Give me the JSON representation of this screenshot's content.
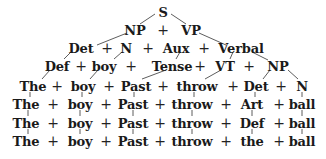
{
  "diagram": {
    "type": "phrase-structure derivation tree",
    "rows": [
      {
        "y": 12,
        "tokens": [
          {
            "text": "S",
            "x": 163
          }
        ]
      },
      {
        "y": 30,
        "tokens": [
          {
            "text": "NP",
            "x": 135
          },
          {
            "text": "+",
            "x": 163
          },
          {
            "text": "VP",
            "x": 191
          }
        ]
      },
      {
        "y": 48,
        "tokens": [
          {
            "text": "Det",
            "x": 81
          },
          {
            "text": "+",
            "x": 107
          },
          {
            "text": "N",
            "x": 126
          },
          {
            "text": "+",
            "x": 148
          },
          {
            "text": "Aux",
            "x": 176
          },
          {
            "text": "+",
            "x": 204
          },
          {
            "text": "Verbal",
            "x": 241
          }
        ]
      },
      {
        "y": 66,
        "tokens": [
          {
            "text": "Def",
            "x": 57
          },
          {
            "text": "+",
            "x": 81
          },
          {
            "text": "boy",
            "x": 104
          },
          {
            "text": "+",
            "x": 131
          },
          {
            "text": "Tense",
            "x": 172
          },
          {
            "text": "+",
            "x": 200
          },
          {
            "text": "VT",
            "x": 225
          },
          {
            "text": "+",
            "x": 249
          },
          {
            "text": "NP",
            "x": 278
          }
        ]
      },
      {
        "y": 86,
        "tokens": [
          {
            "text": "The",
            "x": 33
          },
          {
            "text": "+",
            "x": 57
          },
          {
            "text": "boy",
            "x": 83
          },
          {
            "text": "+",
            "x": 109
          },
          {
            "text": "Past",
            "x": 136
          },
          {
            "text": "+",
            "x": 163
          },
          {
            "text": "throw",
            "x": 197
          },
          {
            "text": "+",
            "x": 233
          },
          {
            "text": "Det",
            "x": 256
          },
          {
            "text": "+",
            "x": 281
          },
          {
            "text": "N",
            "x": 302
          }
        ]
      },
      {
        "y": 104,
        "tokens": [
          {
            "text": "The",
            "x": 26
          },
          {
            "text": "+",
            "x": 53
          },
          {
            "text": "boy",
            "x": 80
          },
          {
            "text": "+",
            "x": 106
          },
          {
            "text": "Past",
            "x": 133
          },
          {
            "text": "+",
            "x": 160
          },
          {
            "text": "throw",
            "x": 192
          },
          {
            "text": "+",
            "x": 226
          },
          {
            "text": "Art",
            "x": 252
          },
          {
            "text": "+",
            "x": 279
          },
          {
            "text": "ball",
            "x": 302
          }
        ]
      },
      {
        "y": 123,
        "tokens": [
          {
            "text": "The",
            "x": 26
          },
          {
            "text": "+",
            "x": 53
          },
          {
            "text": "boy",
            "x": 80
          },
          {
            "text": "+",
            "x": 106
          },
          {
            "text": "Past",
            "x": 133
          },
          {
            "text": "+",
            "x": 160
          },
          {
            "text": "throw",
            "x": 192
          },
          {
            "text": "+",
            "x": 226
          },
          {
            "text": "Def",
            "x": 252
          },
          {
            "text": "+",
            "x": 279
          },
          {
            "text": "ball",
            "x": 302
          }
        ]
      },
      {
        "y": 141,
        "tokens": [
          {
            "text": "The",
            "x": 26
          },
          {
            "text": "+",
            "x": 53
          },
          {
            "text": "boy",
            "x": 80
          },
          {
            "text": "+",
            "x": 106
          },
          {
            "text": "Past",
            "x": 133
          },
          {
            "text": "+",
            "x": 160
          },
          {
            "text": "throw",
            "x": 192
          },
          {
            "text": "+",
            "x": 226
          },
          {
            "text": "the",
            "x": 252
          },
          {
            "text": "+",
            "x": 279
          },
          {
            "text": "ball",
            "x": 302
          }
        ]
      }
    ],
    "edges": [
      [
        155,
        14,
        140,
        24
      ],
      [
        171,
        14,
        186,
        24
      ],
      [
        127,
        33,
        97,
        45
      ],
      [
        199,
        33,
        226,
        45
      ],
      [
        72,
        51,
        64,
        59
      ],
      [
        122,
        52,
        114,
        59
      ],
      [
        180,
        52,
        176,
        59
      ],
      [
        233,
        52,
        230,
        59
      ],
      [
        252,
        52,
        268,
        60
      ],
      [
        50,
        70,
        42,
        79
      ],
      [
        98,
        70,
        90,
        79
      ],
      [
        166,
        70,
        142,
        79
      ],
      [
        221,
        70,
        205,
        79
      ],
      [
        270,
        70,
        263,
        79
      ],
      [
        288,
        70,
        298,
        79
      ],
      [
        30,
        92,
        30,
        97
      ],
      [
        82,
        92,
        82,
        97
      ],
      [
        134,
        92,
        134,
        97
      ],
      [
        194,
        92,
        194,
        97
      ],
      [
        255,
        92,
        255,
        97
      ],
      [
        302,
        92,
        302,
        97
      ],
      [
        28,
        110,
        28,
        116
      ],
      [
        80,
        110,
        80,
        116
      ],
      [
        133,
        110,
        133,
        116
      ],
      [
        192,
        110,
        192,
        116
      ],
      [
        252,
        110,
        252,
        116
      ],
      [
        302,
        110,
        302,
        116
      ],
      [
        28,
        129,
        28,
        134
      ],
      [
        80,
        129,
        80,
        134
      ],
      [
        133,
        129,
        133,
        134
      ],
      [
        192,
        129,
        192,
        134
      ],
      [
        252,
        129,
        252,
        134
      ],
      [
        302,
        129,
        302,
        134
      ]
    ]
  }
}
